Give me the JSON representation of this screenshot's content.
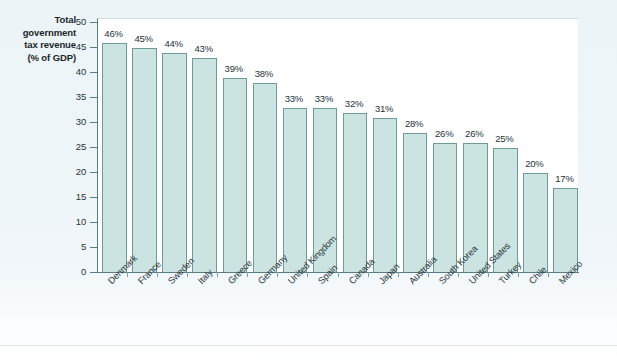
{
  "axis_title": {
    "line1": "Total government",
    "line2": "tax revenue",
    "line3": "(% of GDP)"
  },
  "chart_data": {
    "type": "bar",
    "title": "Total government tax revenue (% of GDP)",
    "xlabel": "",
    "ylabel": "Total government tax revenue (% of GDP)",
    "ylim": [
      0,
      50
    ],
    "ytick_step": 5,
    "grid": false,
    "legend": "none",
    "bar_color": "#cbe3e1",
    "bar_border_color": "#6f9a9a",
    "axis_color": "#5a7d80",
    "panel_color": "#ffffff",
    "page_color": "#eef5f9",
    "yticks": [
      "0",
      "5",
      "10",
      "15",
      "20",
      "25",
      "30",
      "35",
      "40",
      "45",
      "50"
    ],
    "categories": [
      "Denmark",
      "France",
      "Sweden",
      "Italy",
      "Greece",
      "Germany",
      "United Kingdom",
      "Spain",
      "Canada",
      "Japan",
      "Australia",
      "South Korea",
      "United States",
      "Turkey",
      "Chile",
      "Mexico"
    ],
    "values": [
      46,
      45,
      44,
      43,
      39,
      38,
      33,
      33,
      32,
      31,
      28,
      26,
      26,
      25,
      20,
      17
    ],
    "data_labels": [
      "46%",
      "45%",
      "44%",
      "43%",
      "39%",
      "38%",
      "33%",
      "33%",
      "32%",
      "31%",
      "28%",
      "26%",
      "26%",
      "25%",
      "20%",
      "17%"
    ]
  }
}
